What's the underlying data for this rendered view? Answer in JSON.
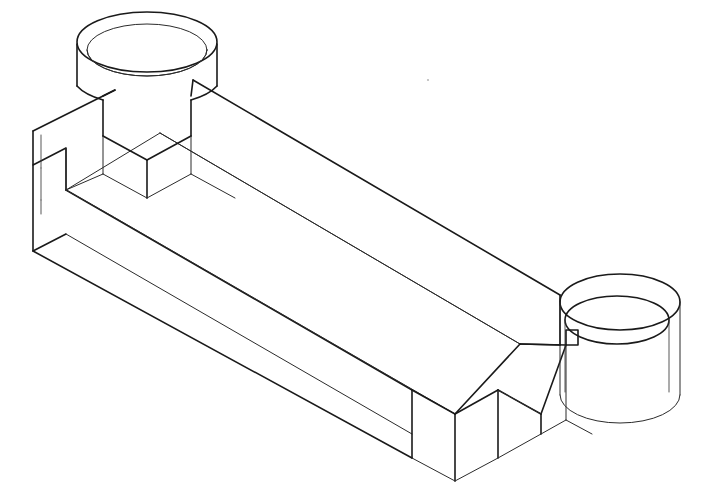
{
  "document": {
    "title": "Isometric Technical Line Drawing",
    "background_color": "#ffffff",
    "line_color": "#1a1a1a",
    "canvas_width": 711,
    "canvas_height": 501,
    "drawing_style": "wireframe-isometric-cad",
    "subject": "Rectangular channel bracket with cylindrical boss and cylindrical collar"
  },
  "geometry": {
    "projection": "isometric",
    "axis_slope_right": 0.5,
    "axis_slope_left": -0.5,
    "features": [
      {
        "name": "left-cylindrical-boss",
        "type": "cylinder",
        "center_x": 147,
        "center_y": 42,
        "radius_x": 70,
        "radius_y": 30,
        "wall_thickness": 8,
        "height": 70
      },
      {
        "name": "right-cylindrical-collar",
        "type": "cylinder",
        "center_x": 620,
        "center_y": 302,
        "radius_x": 60,
        "radius_y": 28,
        "wall_thickness": 8,
        "height": 95
      },
      {
        "name": "main-channel-body",
        "type": "extruded-u-channel",
        "length": 520,
        "width": 150,
        "wall_height": 60
      },
      {
        "name": "left-end-step-notch",
        "type": "rectangular-notch"
      },
      {
        "name": "right-end-step-notch",
        "type": "rectangular-notch"
      }
    ]
  },
  "artifacts": {
    "speck": {
      "x": 428,
      "y": 80,
      "size": 2.2,
      "color": "#b9b9b9"
    }
  },
  "paths": {
    "boss_top_outer_ellipse": "M 77,47 A 70,30 0 0 1 217,47 A 70,30 0 0 1 77,47 Z",
    "boss_top_inner_ellipse": "M 89,51 A 58,25 0 0 1 205,51 A 58,25 0 0 1 89,51 Z",
    "boss_bore_arc": "M 89,51 A 58,25 0 0 0 205,51",
    "boss_outer_left_wall": "M 77,47 L 77,86",
    "boss_outer_right_wall": "M 217,47 L 217,86",
    "boss_outer_bottom_arc": "M 77,47 A 70,30 0 0 0 217,47",
    "left_collar_front": "M 77,86 L 100,99 L 100,135 L 128,149 L 160,133 L 160,97 L 193,80",
    "right_collar_front": "M 217,86 L 193,98",
    "channel_outer_top_left": "M 33,131 L 115,90",
    "channel_top_ridge_long": "M 193,80 L 560,295",
    "channel_inner_floor_long": "M 160,133 L 520,344",
    "body_bottom_long_edge": "M 33,251 L 412,458",
    "body_front_long_edge": "M 66,190 L 412,458"
  }
}
